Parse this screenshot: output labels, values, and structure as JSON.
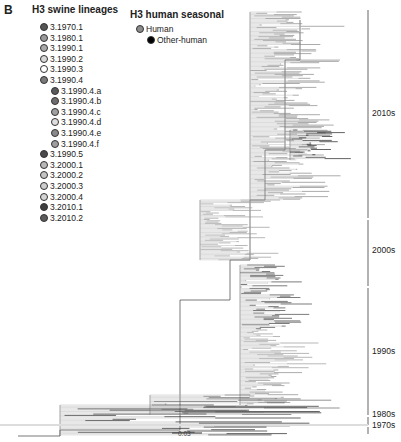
{
  "panel_label": "B",
  "swine_legend": {
    "title": "H3 swine lineages",
    "items": [
      {
        "label": "3.1970.1",
        "color": "#555555",
        "indent": 0
      },
      {
        "label": "3.1980.1",
        "color": "#9a9a9a",
        "indent": 0
      },
      {
        "label": "3.1990.1",
        "color": "#a9a9a9",
        "indent": 0
      },
      {
        "label": "3.1990.2",
        "color": "#d8d8d8",
        "indent": 0
      },
      {
        "label": "3.1990.3",
        "color": "#ffffff",
        "indent": 0
      },
      {
        "label": "3.1990.4",
        "color": "#7a7a7a",
        "indent": 0
      },
      {
        "label": "3.1990.4.a",
        "color": "#5a5a5a",
        "indent": 1
      },
      {
        "label": "3.1990.4.b",
        "color": "#6e6e6e",
        "indent": 1
      },
      {
        "label": "3.1990.4.c",
        "color": "#a0a0a0",
        "indent": 1
      },
      {
        "label": "3.1990.4.d",
        "color": "#dedede",
        "indent": 1
      },
      {
        "label": "3.1990.4.e",
        "color": "#8a8a8a",
        "indent": 1
      },
      {
        "label": "3.1990.4.f",
        "color": "#9e9e9e",
        "indent": 1
      },
      {
        "label": "3.1990.5",
        "color": "#4a4a4a",
        "indent": 0
      },
      {
        "label": "3.2000.1",
        "color": "#b8b8b8",
        "indent": 0
      },
      {
        "label": "3.2000.2",
        "color": "#c4c4c4",
        "indent": 0
      },
      {
        "label": "3.2000.3",
        "color": "#cdcdcd",
        "indent": 0
      },
      {
        "label": "3.2000.4",
        "color": "#d4d4d4",
        "indent": 0
      },
      {
        "label": "3.2010.1",
        "color": "#3f3f3f",
        "indent": 0
      },
      {
        "label": "3.2010.2",
        "color": "#5c5c5c",
        "indent": 0
      }
    ]
  },
  "human_legend": {
    "title": "H3 human seasonal",
    "items": [
      {
        "label": "Human",
        "color": "#8c8c8c"
      },
      {
        "label": "Other-human",
        "color": "#000000"
      }
    ]
  },
  "eras": [
    "2010s",
    "2000s",
    "1990s",
    "1980s",
    "1970s"
  ],
  "scale_bar": "0.03"
}
